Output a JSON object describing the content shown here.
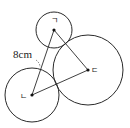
{
  "figure": {
    "circles": [
      {
        "id": "ㄱ",
        "label": "ㄱ",
        "cx": 54,
        "cy": 30,
        "r": 18
      },
      {
        "id": "ㄴ",
        "label": "ㄴ",
        "cx": 32,
        "cy": 95,
        "r": 27
      },
      {
        "id": "ㄷ",
        "label": "ㄷ",
        "cx": 88,
        "cy": 70,
        "r": 35
      }
    ],
    "segments": [
      {
        "from": "ㄱ",
        "to": "ㄴ"
      },
      {
        "from": "ㄱ",
        "to": "ㄷ"
      },
      {
        "from": "ㄴ",
        "to": "ㄷ"
      }
    ],
    "labels": {
      "center_a": "ㄱ",
      "center_b": "ㄴ",
      "center_c": "ㄷ",
      "length_ab": "8cm"
    },
    "colors": {
      "stroke": "#2a2a2a",
      "background": "#ffffff"
    }
  }
}
